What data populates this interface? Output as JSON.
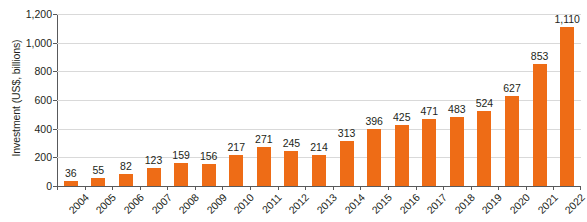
{
  "chart_data": {
    "type": "bar",
    "title": "",
    "xlabel": "",
    "ylabel": "Investment (US$, billions)",
    "categories": [
      "2004",
      "2005",
      "2006",
      "2007",
      "2008",
      "2009",
      "2010",
      "2011",
      "2012",
      "2013",
      "2014",
      "2015",
      "2016",
      "2017",
      "2018",
      "2019",
      "2020",
      "2021",
      "2022"
    ],
    "values": [
      36,
      55,
      82,
      123,
      159,
      156,
      217,
      271,
      245,
      214,
      313,
      396,
      425,
      471,
      483,
      524,
      627,
      853,
      1110
    ],
    "value_labels": [
      "36",
      "55",
      "82",
      "123",
      "159",
      "156",
      "217",
      "271",
      "245",
      "214",
      "313",
      "396",
      "425",
      "471",
      "483",
      "524",
      "627",
      "853",
      "1,110"
    ],
    "ylim": [
      0,
      1200
    ],
    "yticks": [
      0,
      200,
      400,
      600,
      800,
      1000,
      1200
    ],
    "ytick_labels": [
      "0",
      "200",
      "400",
      "600",
      "800",
      "1,000",
      "1,200"
    ],
    "grid": true,
    "legend": "none",
    "series_color": "#ee6c16",
    "axis_color": "#58595b",
    "grid_color": "#d9d9d9",
    "background": "#ffffff"
  }
}
